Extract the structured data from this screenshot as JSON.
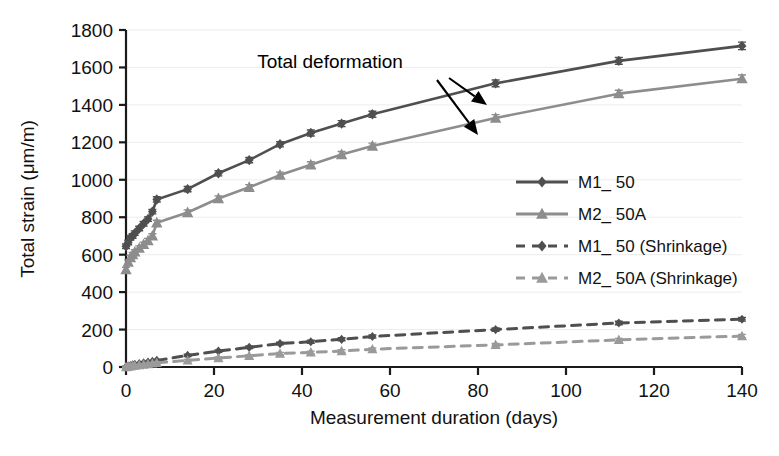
{
  "chart_data": {
    "type": "line",
    "title": "",
    "xlabel": "Measurement duration (days)",
    "ylabel": "Total strain (μm/m)",
    "xlim": [
      0,
      140
    ],
    "ylim": [
      0,
      1800
    ],
    "xticks": [
      0,
      20,
      40,
      60,
      80,
      100,
      120,
      140
    ],
    "yticks": [
      0,
      200,
      400,
      600,
      800,
      1000,
      1200,
      1400,
      1600,
      1800
    ],
    "grid": "horizontal",
    "legend_position": "center-right",
    "error_bars": true,
    "annotations": [
      {
        "text": "Total deformation",
        "x_px": 330,
        "y_px": 68,
        "arrows": [
          {
            "from_x_px": 449,
            "from_y_px": 78,
            "to_x_px": 487,
            "to_y_px": 105
          },
          {
            "from_x_px": 437,
            "from_y_px": 80,
            "to_x_px": 478,
            "to_y_px": 135
          }
        ]
      }
    ],
    "series": [
      {
        "name": "M1_ 50",
        "color": "#4f4f4f",
        "marker": "diamond",
        "linestyle": "solid",
        "x": [
          0,
          0.5,
          1,
          1.5,
          2,
          3,
          4,
          5,
          6,
          7,
          14,
          21,
          28,
          35,
          42,
          49,
          56,
          84,
          112,
          140
        ],
        "y": [
          645,
          665,
          690,
          700,
          715,
          740,
          765,
          790,
          830,
          895,
          950,
          1035,
          1105,
          1190,
          1250,
          1300,
          1350,
          1515,
          1635,
          1715
        ],
        "yerr": [
          12,
          12,
          12,
          12,
          12,
          12,
          12,
          12,
          12,
          14,
          14,
          14,
          14,
          14,
          16,
          16,
          16,
          18,
          18,
          20
        ]
      },
      {
        "name": "M2_ 50A",
        "color": "#8d8d8d",
        "marker": "triangle",
        "linestyle": "solid",
        "x": [
          0,
          0.5,
          1,
          1.5,
          2,
          3,
          4,
          5,
          6,
          7,
          14,
          21,
          28,
          35,
          42,
          49,
          56,
          84,
          112,
          140
        ],
        "y": [
          520,
          560,
          585,
          600,
          615,
          635,
          655,
          675,
          700,
          770,
          825,
          900,
          960,
          1025,
          1080,
          1135,
          1180,
          1330,
          1460,
          1540
        ],
        "yerr": [
          12,
          12,
          12,
          12,
          12,
          12,
          12,
          12,
          12,
          14,
          14,
          14,
          14,
          16,
          16,
          16,
          16,
          18,
          18,
          20
        ]
      },
      {
        "name": "M1_ 50 (Shrinkage)",
        "color": "#4f4f4f",
        "marker": "diamond",
        "linestyle": "dashed",
        "x": [
          0,
          0.5,
          1,
          1.5,
          2,
          3,
          4,
          5,
          6,
          7,
          14,
          21,
          28,
          35,
          42,
          49,
          56,
          84,
          112,
          140
        ],
        "y": [
          0,
          4,
          8,
          11,
          14,
          18,
          22,
          26,
          30,
          35,
          62,
          85,
          105,
          125,
          135,
          148,
          163,
          200,
          235,
          255
        ],
        "yerr": [
          4,
          4,
          4,
          4,
          4,
          4,
          4,
          4,
          4,
          5,
          6,
          6,
          7,
          7,
          8,
          8,
          8,
          9,
          9,
          10
        ]
      },
      {
        "name": "M2_ 50A (Shrinkage)",
        "color": "#9a9a9a",
        "marker": "triangle",
        "linestyle": "dashed",
        "x": [
          0,
          0.5,
          1,
          1.5,
          2,
          3,
          4,
          5,
          6,
          7,
          14,
          21,
          28,
          35,
          42,
          49,
          56,
          84,
          112,
          140
        ],
        "y": [
          0,
          2,
          4,
          6,
          8,
          10,
          13,
          16,
          19,
          22,
          35,
          48,
          60,
          72,
          78,
          85,
          95,
          118,
          145,
          165
        ],
        "yerr": [
          4,
          4,
          4,
          4,
          4,
          4,
          4,
          4,
          4,
          5,
          5,
          6,
          6,
          6,
          7,
          7,
          7,
          8,
          8,
          9
        ]
      }
    ],
    "legend": [
      {
        "label": "M1_ 50",
        "color": "#4f4f4f",
        "marker": "diamond",
        "linestyle": "solid"
      },
      {
        "label": "M2_ 50A",
        "color": "#8d8d8d",
        "marker": "triangle",
        "linestyle": "solid"
      },
      {
        "label": "M1_ 50 (Shrinkage)",
        "color": "#4f4f4f",
        "marker": "diamond",
        "linestyle": "dashed"
      },
      {
        "label": "M2_ 50A (Shrinkage)",
        "color": "#9a9a9a",
        "marker": "triangle",
        "linestyle": "dashed"
      }
    ]
  },
  "colors": {
    "background": "#ffffff",
    "axis": "#1a1a1a",
    "grid": "#ededed",
    "series_dark": "#4f4f4f",
    "series_light": "#8d8d8d",
    "text": "#111111"
  }
}
